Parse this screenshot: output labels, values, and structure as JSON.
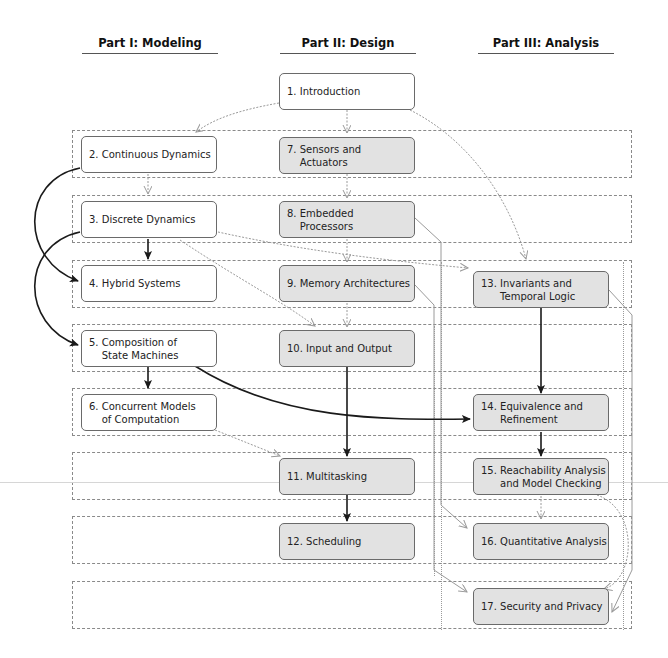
{
  "headers": {
    "part1": "Part I: Modeling",
    "part2": "Part II: Design",
    "part3": "Part III: Analysis"
  },
  "chapters": {
    "c1": "1. Introduction",
    "c2": "2. Continuous Dynamics",
    "c3": "3. Discrete Dynamics",
    "c4": "4. Hybrid Systems",
    "c5": "5. Composition of\n    State Machines",
    "c6": "6. Concurrent Models\n    of Computation",
    "c7": "7. Sensors and\n    Actuators",
    "c8": "8. Embedded\n    Processors",
    "c9": "9. Memory Architectures",
    "c10": "10. Input and Output",
    "c11": "11. Multitasking",
    "c12": "12. Scheduling",
    "c13": "13. Invariants and\n      Temporal Logic",
    "c14": "14. Equivalence and\n      Refinement",
    "c15": "15. Reachability Analysis\n      and Model Checking",
    "c16": "16. Quantitative Analysis",
    "c17": "17. Security and Privacy"
  },
  "colors": {
    "strong_arrow": "#1a1a1a",
    "weak_arrow": "#9a9a9a",
    "band_border": "#8a8a8a",
    "shaded_box": "#e2e2e2"
  }
}
